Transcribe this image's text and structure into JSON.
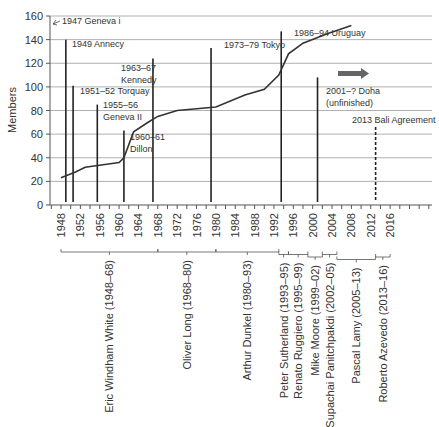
{
  "chart_data": {
    "type": "line",
    "title": "",
    "ylabel": "Members",
    "xlabel": "",
    "ylim": [
      0,
      160
    ],
    "yticks": [
      0,
      20,
      40,
      60,
      80,
      100,
      120,
      140,
      160
    ],
    "xlim": [
      1946,
      2024
    ],
    "xticks": [
      1948,
      1952,
      1956,
      1960,
      1964,
      1968,
      1972,
      1976,
      1980,
      1984,
      1988,
      1992,
      1996,
      2000,
      2004,
      2008,
      2012,
      2016
    ],
    "grid": "horizontal",
    "legend": "none",
    "series": [
      {
        "name": "Members",
        "x": [
          1948,
          1951,
          1953,
          1960,
          1961,
          1963,
          1966,
          1968,
          1972,
          1980,
          1986,
          1990,
          1993,
          1995,
          1998,
          2003,
          2008
        ],
        "y": [
          23,
          28,
          32,
          36,
          40,
          62,
          70,
          75,
          80,
          83,
          93,
          98,
          110,
          128,
          137,
          145,
          152
        ]
      }
    ],
    "rounds": [
      {
        "year": 1947,
        "label": "1947 Geneva i",
        "height": 150,
        "style": "arrow"
      },
      {
        "year": 1949,
        "label": "1949 Annecy",
        "height": 140,
        "style": "solid"
      },
      {
        "year": 1950.5,
        "label": "1951–52 Torquay",
        "height": 101,
        "style": "solid"
      },
      {
        "year": 1955.5,
        "label": "1955–56\nGeneva II",
        "height": 85,
        "style": "solid"
      },
      {
        "year": 1961,
        "label": "1960–61\nDillon",
        "height": 63,
        "style": "solid"
      },
      {
        "year": 1967,
        "label": "1963–67\nKennedy",
        "height": 124,
        "style": "solid"
      },
      {
        "year": 1979,
        "label": "1973–79 Tokyo",
        "height": 133,
        "style": "solid"
      },
      {
        "year": 1993.5,
        "label": "1986–94 Uruguay",
        "height": 147,
        "style": "solid"
      },
      {
        "year": 2001,
        "label": "2001–? Doha\n(unfinished)",
        "height": 108,
        "style": "solid"
      },
      {
        "year": 2013,
        "label": "2013 Bali Agreement",
        "height": 66,
        "style": "dashed"
      }
    ],
    "annotations": [
      {
        "type": "arrow",
        "text": "Doha continuing",
        "x_from": 2003,
        "x_to": 2010,
        "y": 110
      }
    ],
    "directors_general": [
      {
        "name": "Eric Windham White (1948–68)",
        "start": 1948,
        "end": 1968
      },
      {
        "name": "Oliver Long (1968–80)",
        "start": 1968,
        "end": 1980
      },
      {
        "name": "Arthur Dunkel (1980–93)",
        "start": 1980,
        "end": 1993
      },
      {
        "name": "Peter Sutherland (1993–95)",
        "start": 1993,
        "end": 1995
      },
      {
        "name": "Renato Ruggiero (1995–99)",
        "start": 1995,
        "end": 1999
      },
      {
        "name": "Mike Moore (1999–02)",
        "start": 1999,
        "end": 2002
      },
      {
        "name": "Supachai Panitchpakdi (2002–05)",
        "start": 2002,
        "end": 2005
      },
      {
        "name": "Pascal Lamy (2005–13)",
        "start": 2005,
        "end": 2013
      },
      {
        "name": "Roberto Azevedo (2013–16)",
        "start": 2013,
        "end": 2016
      }
    ]
  },
  "colors": {
    "line": "#333333",
    "grid": "#b0b0b0",
    "axis": "#555555",
    "arrow": "#666666",
    "text": "#333333"
  }
}
